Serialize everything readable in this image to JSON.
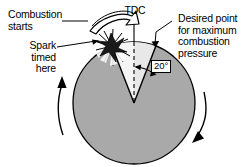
{
  "figure": {
    "background_color": "#ffffff",
    "line_color": "#000000",
    "piston_fill": "#a8a8a8",
    "flame_fill": "#f2f2f2"
  },
  "labels": {
    "combustion_starts": "Combustion\nstarts",
    "spark_timed_here": "Spark\ntimed\nhere",
    "tdc": "TDC",
    "desired_point": "Desired point\nfor maximum\ncombustion\npressure",
    "angle": "20°"
  },
  "annotations": {
    "rotation_arrow_left": "rotation-arrow-up",
    "rotation_arrow_right": "rotation-arrow-down",
    "combustion_arrow": "hollow-curved-arrow",
    "spark_icon": "spark-burst-icon",
    "tdc_line": "top-dead-center-dashed-line"
  },
  "geometry": {
    "center_x": 134,
    "center_y": 103,
    "radius": 61,
    "angle_degrees": 20
  }
}
